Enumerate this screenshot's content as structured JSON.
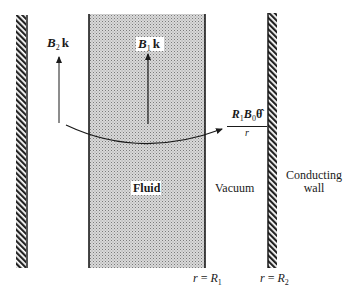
{
  "figure": {
    "regions": {
      "fluid": "Fluid",
      "vacuum": "Vacuum",
      "wall_line1": "Conducting",
      "wall_line2": "wall"
    },
    "vectors": {
      "b2": {
        "symbol": "B",
        "subscript": "2",
        "unit": "k"
      },
      "b1": {
        "symbol": "B",
        "subscript": "1",
        "unit": "k"
      },
      "azimuthal": {
        "numerator_r": "R",
        "numerator_r_sub": "1",
        "numerator_b": "B",
        "numerator_b_sub": "0",
        "numerator_unit": "θ̂",
        "denominator": "r"
      }
    },
    "boundaries": {
      "r1": {
        "lhs": "r",
        "eq": "=",
        "rhs": "R",
        "sub": "1"
      },
      "r2": {
        "lhs": "r",
        "eq": "=",
        "rhs": "R",
        "sub": "2"
      }
    },
    "colors": {
      "ink": "#1a1a1a",
      "stipple_bg": "#d4d4d4",
      "stipple_dot": "#8a8a8a",
      "background": "#ffffff"
    }
  }
}
